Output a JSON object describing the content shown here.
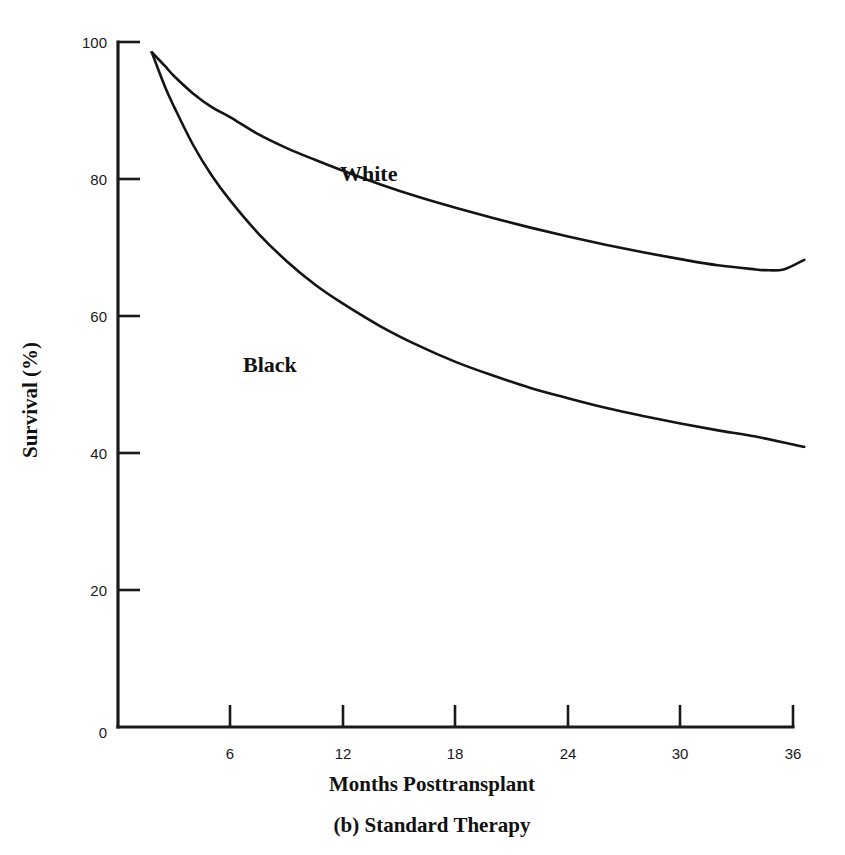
{
  "figure": {
    "caption": "(b) Standard Therapy",
    "background_color": "#ffffff",
    "ink_color": "#141414"
  },
  "axes": {
    "y_title": "Survival (%)",
    "x_title": "Months Posttransplant",
    "y_ticks": [
      "0",
      "20",
      "40",
      "60",
      "80",
      "100"
    ],
    "x_ticks": [
      "0",
      "6",
      "12",
      "18",
      "24",
      "30",
      "36"
    ]
  },
  "labels": {
    "white": "White",
    "black": "Black"
  },
  "chart_data": {
    "type": "line",
    "title": "(b) Standard Therapy",
    "xlabel": "Months Posttransplant",
    "ylabel": "Survival (%)",
    "xlim": [
      0,
      36
    ],
    "ylim": [
      0,
      100
    ],
    "xticks": [
      0,
      6,
      12,
      18,
      24,
      30,
      36
    ],
    "yticks": [
      0,
      20,
      40,
      60,
      80,
      100
    ],
    "grid": false,
    "legend": "inline-annotations",
    "series": [
      {
        "name": "White",
        "x": [
          1.8,
          2.5,
          3,
          4,
          5,
          6,
          7.5,
          9,
          10.5,
          12,
          14,
          16,
          18,
          20,
          22,
          24,
          26,
          28,
          30,
          32,
          34,
          34.5,
          35.5,
          36.6
        ],
        "values": [
          98.5,
          96.5,
          95,
          92.5,
          90.5,
          89,
          86.5,
          84.5,
          82.8,
          81.2,
          79.2,
          77.4,
          75.8,
          74.3,
          72.9,
          71.6,
          70.4,
          69.3,
          68.3,
          67.4,
          66.8,
          66.7,
          66.8,
          68.2
        ]
      },
      {
        "name": "Black",
        "x": [
          1.8,
          2.5,
          3,
          4,
          5,
          6,
          7.5,
          9,
          10.5,
          12,
          14,
          16,
          18,
          20,
          22,
          24,
          26,
          28,
          30,
          32,
          34,
          36.6
        ],
        "values": [
          98.5,
          93.5,
          90.5,
          85,
          80.5,
          76.8,
          72,
          68,
          64.6,
          61.8,
          58.5,
          55.7,
          53.3,
          51.3,
          49.5,
          48,
          46.6,
          45.4,
          44.3,
          43.3,
          42.4,
          40.9
        ]
      }
    ],
    "annotations": [
      {
        "text": "White",
        "x": 12.0,
        "y": 79.0
      },
      {
        "text": "Black",
        "x": 6.8,
        "y": 54.5
      }
    ]
  }
}
